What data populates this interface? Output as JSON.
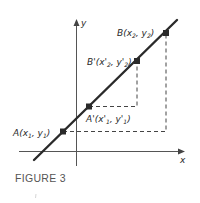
{
  "figure": {
    "caption": "FIGURE 3",
    "axes": {
      "x_label": "x",
      "y_label": "y"
    },
    "points": [
      {
        "id": "A",
        "name": "A",
        "coords": [
          "x",
          "1",
          "y",
          "1"
        ],
        "label": "A(x1, y1)",
        "px": [
          63,
          131
        ]
      },
      {
        "id": "A_prime",
        "name": "A'",
        "coords": [
          "x'",
          "1",
          "y'",
          "1"
        ],
        "label": "A'(x'1, y'1)",
        "px": [
          89,
          106
        ]
      },
      {
        "id": "B_prime",
        "name": "B'",
        "coords": [
          "x'",
          "2",
          "y'",
          "2"
        ],
        "label": "B'(x'2, y'2)",
        "px": [
          137,
          61
        ]
      },
      {
        "id": "B",
        "name": "B",
        "coords": [
          "x",
          "2",
          "y",
          "2"
        ],
        "label": "B(x2, y2)",
        "px": [
          166,
          33
        ]
      }
    ],
    "line": {
      "from": [
        34,
        160
      ],
      "to": [
        177,
        20
      ]
    },
    "colors": {
      "line": "#2a2a2a",
      "axis": "#555555",
      "dash": "#444444",
      "caption": "#555555"
    }
  }
}
